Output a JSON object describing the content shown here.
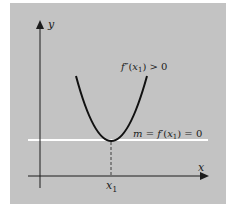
{
  "figure": {
    "axes": {
      "x_label": "x",
      "y_label": "y"
    },
    "x_tick": {
      "label_base": "x",
      "label_sub": "1"
    },
    "curve": {
      "type": "parabola opening upward",
      "annotation": {
        "f": "f",
        "prime": "″",
        "open": "(",
        "x": "x",
        "sub": "1",
        "close": ")",
        "rel": " > 0"
      }
    },
    "tangent": {
      "annotation": {
        "m": "m",
        "eq1": " = ",
        "f": "f",
        "prime": "′",
        "open": "(",
        "x": "x",
        "sub": "1",
        "close": ")",
        "eq2": " = 0"
      }
    },
    "colors": {
      "background": "#ffffff",
      "panel": "#c3c3c3",
      "ink": "#1c1c1c",
      "tangent_line": "#ffffff"
    }
  }
}
